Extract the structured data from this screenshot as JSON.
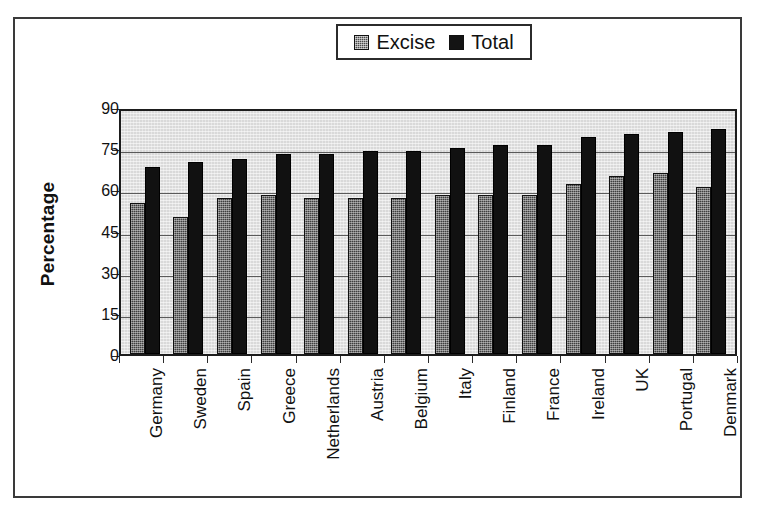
{
  "chart_data": {
    "type": "bar",
    "title": "",
    "xlabel": "",
    "ylabel": "Percentage",
    "ylim": [
      0,
      90
    ],
    "yticks": [
      0,
      15,
      30,
      45,
      60,
      75,
      90
    ],
    "grid": true,
    "legend_position": "top-center",
    "categories": [
      "Germany",
      "Sweden",
      "Spain",
      "Greece",
      "Netherlands",
      "Austria",
      "Belgium",
      "Italy",
      "Finland",
      "France",
      "Ireland",
      "UK",
      "Portugal",
      "Denmark"
    ],
    "series": [
      {
        "name": "Excise",
        "color": "#3f3f3f",
        "values": [
          55,
          50,
          57,
          58,
          57,
          57,
          57,
          58,
          58,
          58,
          62,
          65,
          66,
          61
        ]
      },
      {
        "name": "Total",
        "color": "#111111",
        "values": [
          68,
          70,
          71,
          73,
          73,
          74,
          74,
          75,
          76,
          76,
          79,
          80,
          81,
          82
        ]
      }
    ]
  },
  "legend": {
    "entries": [
      {
        "label": "Excise",
        "swatch": "excise-swatch"
      },
      {
        "label": "Total",
        "swatch": "total-swatch"
      }
    ]
  },
  "axis": {
    "y_title": "Percentage",
    "y_tick_labels": [
      "90",
      "75",
      "60",
      "45",
      "30",
      "15",
      "0"
    ]
  }
}
